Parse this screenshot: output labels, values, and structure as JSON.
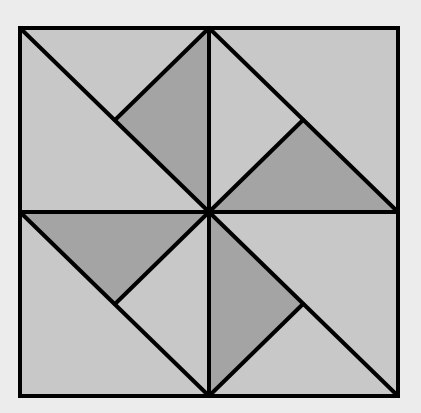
{
  "diagram": {
    "colors": {
      "background": "#ececec",
      "light_fill": "#c8c8c8",
      "dark_fill": "#a4a4a4",
      "stroke": "#000000"
    },
    "frame": {
      "x1": 20,
      "y1": 28,
      "x2": 398,
      "y2": 396,
      "cx": 209,
      "cy": 212
    },
    "dark_triangles": [
      "209,28 115,120 209,212",
      "209,212 303,120 398,212",
      "20,212 209,212 115,304",
      "209,212 303,304 209,396"
    ],
    "lines": [
      [
        20,
        28,
        209,
        212
      ],
      [
        209,
        28,
        115,
        120
      ],
      [
        209,
        28,
        398,
        212
      ],
      [
        209,
        212,
        303,
        120
      ],
      [
        20,
        212,
        209,
        396
      ],
      [
        209,
        212,
        115,
        304
      ],
      [
        209,
        212,
        398,
        396
      ],
      [
        209,
        396,
        303,
        304
      ],
      [
        209,
        28,
        209,
        396
      ],
      [
        20,
        212,
        398,
        212
      ]
    ]
  }
}
